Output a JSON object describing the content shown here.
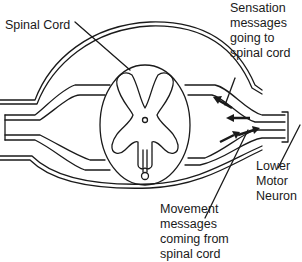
{
  "diagram": {
    "colors": {
      "line": "#1a1a1a",
      "background": "#ffffff"
    },
    "labels": {
      "spinal_cord": "Spinal Cord",
      "sensation": [
        "Sensation",
        "messages",
        "going to",
        "spinal cord"
      ],
      "lower_motor_neuron": [
        "Lower",
        "Motor",
        "Neuron"
      ],
      "movement": [
        "Movement",
        "messages",
        "coming from",
        "spinal cord"
      ]
    },
    "arrows": {
      "sensation_direction": "toward-spinal-cord",
      "movement_direction": "away-from-spinal-cord"
    }
  }
}
